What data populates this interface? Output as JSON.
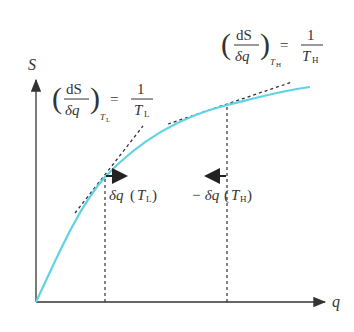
{
  "axes": {
    "y_label": "S",
    "x_label": "q"
  },
  "equations": {
    "low": {
      "num": "dS",
      "den": "δq",
      "subscript_T": "T",
      "subscript_sub": "L",
      "equals": "=",
      "rhs_num": "1",
      "rhs_den_T": "T",
      "rhs_den_sub": "L"
    },
    "high": {
      "num": "dS",
      "den": "δq",
      "subscript_T": "T",
      "subscript_sub": "H",
      "equals": "=",
      "rhs_num": "1",
      "rhs_den_T": "T",
      "rhs_den_sub": "H"
    }
  },
  "annotations": {
    "low_label_prefix": "δq",
    "low_label_T": "T",
    "low_label_sub": "L",
    "high_label_prefix": "− δq",
    "high_label_T": "T",
    "high_label_sub": "H"
  },
  "colors": {
    "curve": "#5fd3e3",
    "axes": "#333333",
    "dashed": "#333333"
  }
}
